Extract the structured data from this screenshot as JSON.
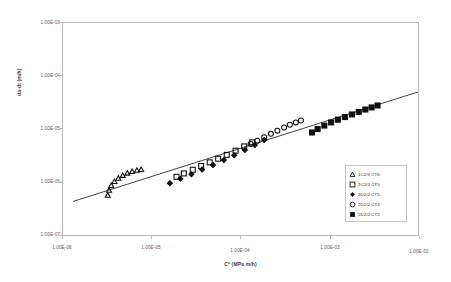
{
  "chart_data": {
    "type": "scatter",
    "title": "",
    "xlabel": "C* (MPa m/h)",
    "ylabel": "da-dt (m/h)",
    "scale": "log-log",
    "grid": false,
    "legend_position": "inside-lower-right",
    "xlim": [
      1e-06,
      0.01
    ],
    "ylim": [
      1e-07,
      0.001
    ],
    "xticks": [
      "1.00E-06",
      "1.00E-05",
      "1.00E-04",
      "1.00E-03",
      "1.00E-02"
    ],
    "xtick_values": [
      1e-06,
      1e-05,
      0.0001,
      0.001,
      0.01
    ],
    "yticks": [
      "1.00E-03",
      "1.00E-04",
      "1.00E-05",
      "1.00E-06",
      "1.00E-07"
    ],
    "ytick_values": [
      0.001,
      0.0001,
      1e-05,
      1e-06,
      1e-07
    ],
    "trendline": {
      "name": "reference correlation line",
      "x": [
        1.3e-06,
        0.01
      ],
      "y": [
        4.3e-07,
        5e-05
      ]
    },
    "series": [
      {
        "name": "1C2/3 CT6",
        "marker": "open-triangle",
        "color": "#101010",
        "points": [
          [
            3.2e-06,
            5.6e-07
          ],
          [
            3.3e-06,
            7e-07
          ],
          [
            3.5e-06,
            8.6e-07
          ],
          [
            3.8e-06,
            1.02e-06
          ],
          [
            4.2e-06,
            1.18e-06
          ],
          [
            4.7e-06,
            1.33e-06
          ],
          [
            5.3e-06,
            1.47e-06
          ],
          [
            6e-06,
            1.58e-06
          ],
          [
            6.8e-06,
            1.66e-06
          ],
          [
            7.6e-06,
            1.72e-06
          ]
        ]
      },
      {
        "name": "1C2/3 CT5",
        "marker": "open-square",
        "color": "#101010",
        "points": [
          [
            1.9e-05,
            1.25e-06
          ],
          [
            2.3e-05,
            1.45e-06
          ],
          [
            2.9e-05,
            1.7e-06
          ],
          [
            3.6e-05,
            2e-06
          ],
          [
            4.5e-05,
            2.35e-06
          ],
          [
            5.6e-05,
            2.75e-06
          ],
          [
            7e-05,
            3.25e-06
          ],
          [
            8.8e-05,
            3.9e-06
          ],
          [
            0.00011,
            4.7e-06
          ],
          [
            0.000135,
            5.6e-06
          ]
        ]
      },
      {
        "name": "2D2/2 CT5",
        "marker": "filled-diamond",
        "color": "#101010",
        "points": [
          [
            1.6e-05,
            9.5e-07
          ],
          [
            2.1e-05,
            1.15e-06
          ],
          [
            2.8e-05,
            1.4e-06
          ],
          [
            3.7e-05,
            1.72e-06
          ],
          [
            4.9e-05,
            2.1e-06
          ],
          [
            6.5e-05,
            2.6e-06
          ],
          [
            8.5e-05,
            3.2e-06
          ],
          [
            0.000112,
            4e-06
          ],
          [
            0.000145,
            5e-06
          ],
          [
            0.000185,
            6.2e-06
          ]
        ]
      },
      {
        "name": "2D2/2 CT4",
        "marker": "open-circle",
        "color": "#101010",
        "points": [
          [
            0.00013,
            5.2e-06
          ],
          [
            0.000155,
            6e-06
          ],
          [
            0.000185,
            7e-06
          ],
          [
            0.00022,
            8.1e-06
          ],
          [
            0.00026,
            9.3e-06
          ],
          [
            0.00031,
            1.07e-05
          ],
          [
            0.00036,
            1.2e-05
          ],
          [
            0.00042,
            1.33e-05
          ],
          [
            0.00048,
            1.45e-05
          ]
        ]
      },
      {
        "name": "2D2/2 CT2",
        "marker": "filled-square",
        "color": "#101010",
        "points": [
          [
            0.00064,
            8.6e-06
          ],
          [
            0.00074,
            1e-05
          ],
          [
            0.00088,
            1.16e-05
          ],
          [
            0.00105,
            1.33e-05
          ],
          [
            0.00125,
            1.5e-05
          ],
          [
            0.0015,
            1.68e-05
          ],
          [
            0.0018,
            1.88e-05
          ],
          [
            0.00215,
            2.1e-05
          ],
          [
            0.00255,
            2.33e-05
          ],
          [
            0.003,
            2.55e-05
          ],
          [
            0.0035,
            2.78e-05
          ]
        ]
      }
    ]
  },
  "axes": {
    "y_title": "da-dt (m/h)",
    "x_title": "C* (MPa m/h)",
    "y_labels": [
      "1.00E-03",
      "1.00E-04",
      "1.00E-05",
      "1.00E-06",
      "1.00E-07"
    ],
    "x_labels": [
      "1.00E-06",
      "1.00E-05",
      "1.00E-04",
      "1.00E-03",
      "1.00E-02"
    ]
  },
  "legend": {
    "items": [
      {
        "label": "1C2/3 CT6",
        "marker": "open-triangle"
      },
      {
        "label": "1C2/3 CT5",
        "marker": "open-square"
      },
      {
        "label": "2D2/2 CT5",
        "marker": "filled-diamond"
      },
      {
        "label": "2D2/2 CT4",
        "marker": "open-circle"
      },
      {
        "label": "2D2/2 CT2",
        "marker": "filled-square"
      }
    ]
  },
  "colors": {
    "plot_border": "#b9b9b9",
    "data": "#101010",
    "text": "#4a4a4a"
  }
}
